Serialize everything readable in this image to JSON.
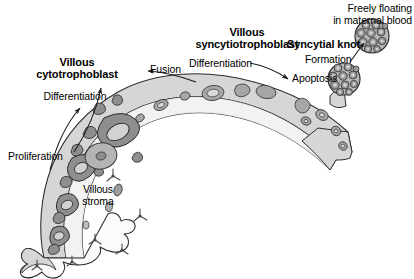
{
  "figure": {
    "background_color": "#ffffff"
  },
  "labels": {
    "villous_cytotrophoblast": "Villous\ncytotrophoblast",
    "villous_cytotrophoblast_line1": "Villous",
    "villous_cytotrophoblast_line2": "cytotrophoblast",
    "villous_syncytiotrophoblast_line1": "Villous",
    "villous_syncytiotrophoblast_line2": "syncytiotrophoblast",
    "syncytial_knot": "Syncytial knot",
    "freely_floating_line1": "Freely floating",
    "freely_floating_line2": "in maternal blood",
    "differentiation_left": "Differentiation",
    "differentiation_right": "Differentiation",
    "proliferation": "Proliferation",
    "fusion": "Fusion",
    "apoptosis": "Apoptosis",
    "formation": "Formation",
    "villous_stroma_line1": "Villous",
    "villous_stroma_line2": "stroma"
  },
  "colors": {
    "outline": "#2b2b2b",
    "syncytium_fill": "#d6d6d6",
    "syncytium_nucleus": "#a6a6a6",
    "cytotrophoblast_fill": "#8e8e8e",
    "cytotrophoblast_nucleus": "#c8c8c8",
    "stroma_fill": "#fbfbfb",
    "stroma_cell": "#777777",
    "knot_fill": "#b8b8b8",
    "knot_nucleus": "#909090",
    "text": "#000000",
    "arrow": "#1a1a1a"
  },
  "structures": {
    "villus": "arched placental villus with syncytiotrophoblast outer layer, cytotrophoblast cells and villous stroma core",
    "syncytial_knot_attached": "multinucleated knot budding from villus surface",
    "syncytial_knot_floating": "detached multinucleated knot in maternal blood"
  }
}
